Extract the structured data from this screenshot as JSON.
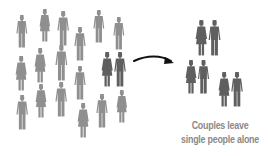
{
  "colors": {
    "single": "#8f8f8f",
    "couple": "#5f5f5f",
    "caption": "#8a8a8a",
    "arrow": "#111111"
  },
  "caption": {
    "line1": "Couples leave",
    "line2": "single people alone"
  },
  "singles": [
    {
      "type": "man",
      "x": 16,
      "y": 15,
      "h": 33
    },
    {
      "type": "woman",
      "x": 39,
      "y": 9,
      "h": 33
    },
    {
      "type": "man",
      "x": 57,
      "y": 11,
      "h": 35
    },
    {
      "type": "man",
      "x": 74,
      "y": 27,
      "h": 34
    },
    {
      "type": "man",
      "x": 93,
      "y": 10,
      "h": 33
    },
    {
      "type": "man",
      "x": 113,
      "y": 17,
      "h": 33
    },
    {
      "type": "woman",
      "x": 15,
      "y": 56,
      "h": 35
    },
    {
      "type": "woman",
      "x": 34,
      "y": 48,
      "h": 35
    },
    {
      "type": "man",
      "x": 55,
      "y": 45,
      "h": 36
    },
    {
      "type": "man",
      "x": 74,
      "y": 66,
      "h": 34
    },
    {
      "type": "man",
      "x": 16,
      "y": 95,
      "h": 35
    },
    {
      "type": "woman",
      "x": 35,
      "y": 84,
      "h": 34
    },
    {
      "type": "man",
      "x": 55,
      "y": 82,
      "h": 35
    },
    {
      "type": "woman",
      "x": 77,
      "y": 103,
      "h": 35
    },
    {
      "type": "man",
      "x": 96,
      "y": 94,
      "h": 34
    },
    {
      "type": "woman",
      "x": 116,
      "y": 90,
      "h": 33
    }
  ],
  "couples": [
    {
      "x": 101,
      "y": 52,
      "h": 35,
      "side": "left"
    },
    {
      "x": 195,
      "y": 20,
      "h": 36,
      "side": "right"
    },
    {
      "x": 185,
      "y": 60,
      "h": 34,
      "side": "right"
    },
    {
      "x": 218,
      "y": 72,
      "h": 35,
      "side": "right"
    }
  ]
}
